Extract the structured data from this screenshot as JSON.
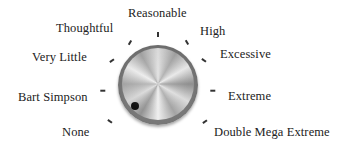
{
  "dial": {
    "name": "volume-style selector knob",
    "current_setting": "None",
    "labels": [
      {
        "text": "None",
        "x": 62,
        "y": 125
      },
      {
        "text": "Bart Simpson",
        "x": 18,
        "y": 90
      },
      {
        "text": "Very Little",
        "x": 32,
        "y": 50
      },
      {
        "text": "Thoughtful",
        "x": 56,
        "y": 21
      },
      {
        "text": "Reasonable",
        "x": 128,
        "y": 6
      },
      {
        "text": "High",
        "x": 200,
        "y": 24
      },
      {
        "text": "Excessive",
        "x": 220,
        "y": 47
      },
      {
        "text": "Extreme",
        "x": 228,
        "y": 89
      },
      {
        "text": "Double Mega Extreme",
        "x": 214,
        "y": 125
      }
    ],
    "ticks": [
      {
        "x": 109,
        "y": 119,
        "angle": -55
      },
      {
        "x": 102,
        "y": 88,
        "angle": 90
      },
      {
        "x": 111,
        "y": 58,
        "angle": 55
      },
      {
        "x": 129,
        "y": 40,
        "angle": 30
      },
      {
        "x": 157,
        "y": 32,
        "angle": 0
      },
      {
        "x": 186,
        "y": 40,
        "angle": -30
      },
      {
        "x": 203,
        "y": 58,
        "angle": -55
      },
      {
        "x": 212,
        "y": 88,
        "angle": 90
      },
      {
        "x": 204,
        "y": 119,
        "angle": 55
      }
    ]
  }
}
